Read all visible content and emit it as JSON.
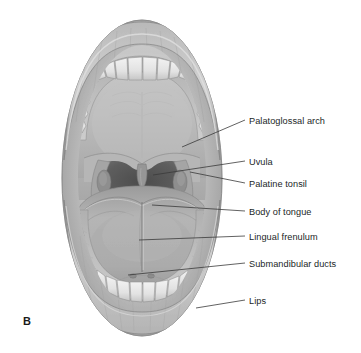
{
  "figure": {
    "letter": "B",
    "style": "grayscale-medical-illustration",
    "background_color": "#ffffff",
    "text_color": "#221f1f",
    "leader_line_color": "#3a3a3a"
  },
  "labels": [
    {
      "id": "palatoglossal-arch",
      "text": "Palatoglossal arch",
      "text_x": 249,
      "text_y": 116,
      "line_x1": 182,
      "line_y1": 147,
      "line_x2": 245,
      "line_y2": 120
    },
    {
      "id": "uvula",
      "text": "Uvula",
      "text_x": 249,
      "text_y": 157,
      "line_x1": 153,
      "line_y1": 175,
      "line_x2": 245,
      "line_y2": 161
    },
    {
      "id": "palatine-tonsil",
      "text": "Palatine tonsil",
      "text_x": 249,
      "text_y": 179,
      "line_x1": 190,
      "line_y1": 172,
      "line_x2": 245,
      "line_y2": 183
    },
    {
      "id": "body-of-tongue",
      "text": "Body of tongue",
      "text_x": 249,
      "text_y": 207,
      "line_x1": 152,
      "line_y1": 205,
      "line_x2": 245,
      "line_y2": 211
    },
    {
      "id": "lingual-frenulum",
      "text": "Lingual frenulum",
      "text_x": 249,
      "text_y": 232,
      "line_x1": 139,
      "line_y1": 240,
      "line_x2": 245,
      "line_y2": 236
    },
    {
      "id": "submandibular-ducts",
      "text": "Submandibular ducts",
      "text_x": 249,
      "text_y": 259,
      "line_x1": 128,
      "line_y1": 275,
      "line_x2": 245,
      "line_y2": 263
    },
    {
      "id": "lips",
      "text": "Lips",
      "text_x": 249,
      "text_y": 296,
      "line_x1": 196,
      "line_y1": 308,
      "line_x2": 245,
      "line_y2": 300
    }
  ],
  "anatomy_parts": [
    "upper-lip",
    "lower-lip",
    "upper-teeth-arch",
    "lower-teeth-arch",
    "hard-palate",
    "soft-palate",
    "uvula",
    "palatoglossal-arch",
    "palatine-tonsil",
    "oropharynx",
    "tongue-underside",
    "lingual-frenulum",
    "submandibular-ducts",
    "floor-of-mouth"
  ]
}
